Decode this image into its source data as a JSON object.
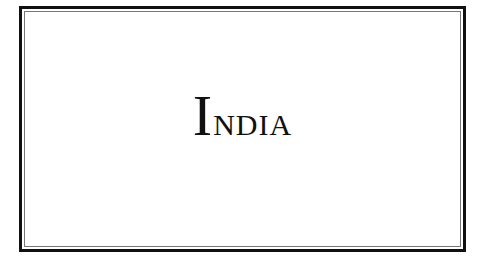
{
  "title": {
    "initial": "I",
    "rest": "ndia",
    "full": "INDIA"
  },
  "colors": {
    "border": "#111111",
    "inner_border": "#777777",
    "background": "#ffffff",
    "text": "#111111"
  }
}
